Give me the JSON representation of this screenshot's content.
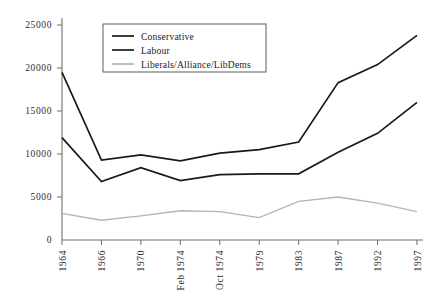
{
  "chart_data": {
    "type": "line",
    "title": "",
    "xlabel": "",
    "ylabel": "",
    "categories": [
      "1964",
      "1966",
      "1970",
      "Feb 1974",
      "Oct 1974",
      "1979",
      "1983",
      "1987",
      "1992",
      "1997"
    ],
    "ylim": [
      0,
      25000
    ],
    "yticks": [
      0,
      5000,
      10000,
      15000,
      20000,
      25000
    ],
    "ytick_labels": [
      "0",
      "5000",
      "10000",
      "15000",
      "20000",
      "25000"
    ],
    "grid": false,
    "legend_position": "top-center",
    "series": [
      {
        "name": "Conservative",
        "color": "#1a1a1a",
        "width": 1.7,
        "values": [
          19500,
          9300,
          9900,
          9200,
          10100,
          10500,
          11400,
          18300,
          20400,
          23800
        ]
      },
      {
        "name": "Labour",
        "color": "#1a1a1a",
        "width": 1.7,
        "values": [
          11900,
          6800,
          8400,
          6900,
          7600,
          7700,
          7700,
          10200,
          12400,
          16000
        ]
      },
      {
        "name": "Liberals/Alliance/LibDems",
        "color": "#b4b4b4",
        "width": 1.3,
        "values": [
          3100,
          2300,
          2800,
          3400,
          3300,
          2600,
          4500,
          5000,
          4300,
          3300
        ]
      }
    ]
  },
  "legend": {
    "entries": [
      {
        "label": "Conservative"
      },
      {
        "label": "Labour"
      },
      {
        "label": "Liberals/Alliance/LibDems"
      }
    ]
  }
}
